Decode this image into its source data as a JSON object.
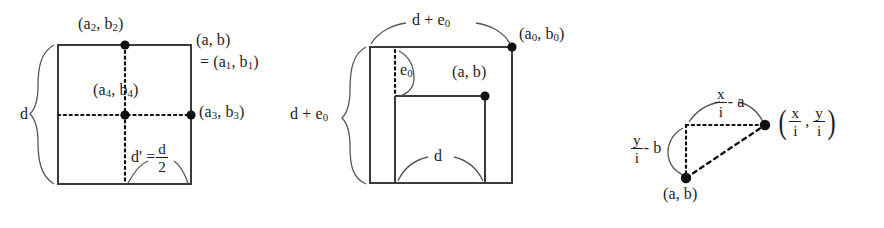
{
  "figure": {
    "type": "geometric-diagram-set",
    "background_color": "#ffffff",
    "line_color": "#3a3a3a",
    "marker_color": "#111111",
    "panels": [
      {
        "id": "panel-left",
        "name": "square-with-midpoints",
        "labels": {
          "top_point": "(a",
          "top_point_sub": "2",
          "top_point_rest": ", b",
          "top_point_sub2": "2",
          "top_point_end": ")",
          "corner_line1": "(a, b)",
          "corner_line2_prefix": "= (a",
          "corner_line2_sub1": "1",
          "corner_line2_mid": ", b",
          "corner_line2_sub2": "1",
          "corner_line2_end": ")",
          "center_prefix": "(a",
          "center_sub1": "4",
          "center_mid": ", b",
          "center_sub2": "4",
          "center_end": ")",
          "right_point_prefix": "(a",
          "right_point_sub1": "3",
          "right_point_mid": ", b",
          "right_point_sub2": "3",
          "right_point_end": ")",
          "left_brace": "d",
          "half_prefix": "d' =",
          "half_num": "d",
          "half_den": "2"
        }
      },
      {
        "id": "panel-middle",
        "name": "nested-squares",
        "labels": {
          "top_brace_prefix": "d + e",
          "top_brace_sub": "0",
          "corner_prefix": "(a",
          "corner_sub1": "0",
          "corner_mid": ", b",
          "corner_sub2": "0",
          "corner_end": ")",
          "inner_gap_prefix": "e",
          "inner_gap_sub": "0",
          "inner_point": "(a, b)",
          "left_brace_prefix": "d + e",
          "left_brace_sub": "0",
          "bottom_brace": "d"
        }
      },
      {
        "id": "panel-right",
        "name": "right-triangle-offsets",
        "labels": {
          "top_edge_num": "x",
          "top_edge_den": "i",
          "top_edge_suffix": "- a",
          "left_edge_num": "y",
          "left_edge_den": "i",
          "left_edge_suffix": "- b",
          "vertex_label": "(a, b)",
          "apex_open": "(",
          "apex_num1": "x",
          "apex_den1": "i",
          "apex_comma": ",",
          "apex_num2": "y",
          "apex_den2": "i",
          "apex_close": ")"
        }
      }
    ]
  }
}
